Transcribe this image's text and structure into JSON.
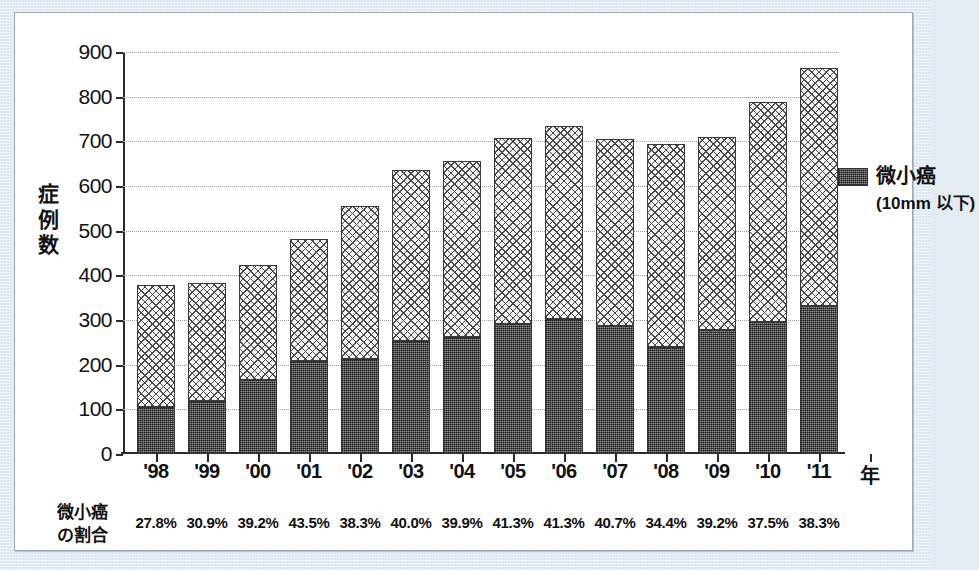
{
  "chart_data": {
    "type": "bar",
    "stacked": true,
    "title": "",
    "xlabel": "年",
    "ylabel": "症例数",
    "ylim": [
      0,
      900
    ],
    "ytick_step": 100,
    "yticks": [
      0,
      100,
      200,
      300,
      400,
      500,
      600,
      700,
      800,
      900
    ],
    "grid": true,
    "legend_position": "right",
    "categories": [
      "'98",
      "'99",
      "'00",
      "'01",
      "'02",
      "'03",
      "'04",
      "'05",
      "'06",
      "'07",
      "'08",
      "'09",
      "'10",
      "'11"
    ],
    "series": [
      {
        "name": "微小癌（10mm 以下）",
        "key": "micro",
        "values": [
          105,
          118,
          166,
          209,
          213,
          254,
          262,
          292,
          303,
          287,
          239,
          278,
          296,
          331
        ]
      },
      {
        "name": "その他",
        "key": "other",
        "values": [
          273,
          264,
          257,
          272,
          343,
          381,
          394,
          415,
          431,
          418,
          456,
          431,
          493,
          533
        ]
      }
    ],
    "totals": [
      378,
      382,
      423,
      481,
      556,
      635,
      656,
      707,
      734,
      705,
      695,
      709,
      789,
      864
    ],
    "ratio_row_label": "微小癌\nの割合",
    "ratios": [
      "27.8%",
      "30.9%",
      "39.2%",
      "43.5%",
      "38.3%",
      "40.0%",
      "39.9%",
      "41.3%",
      "41.3%",
      "40.7%",
      "34.4%",
      "39.2%",
      "37.5%",
      "38.3%"
    ]
  },
  "axes": {
    "y_title_chars": [
      "症",
      "例",
      "数"
    ],
    "y_tick_labels": [
      "900",
      "800",
      "700",
      "600",
      "500",
      "400",
      "300",
      "200",
      "100",
      "0"
    ],
    "x_title": "年"
  },
  "ratio_row": {
    "label_line1": "微小癌",
    "label_line2": "の割合"
  },
  "legend": {
    "title": "微小癌",
    "subtitle": "(10mm 以下)",
    "swatch_name": "micro-cancer-swatch"
  },
  "colors": {
    "page_background": "#dfe9f4",
    "card_background": "#ffffff",
    "card_border": "#9aa7b4",
    "axis": "#2a2a2a",
    "gridline": "#9d9d9d",
    "bar_upper_fill": "#f4f4f4",
    "bar_upper_hatch": "#4a4a4a",
    "bar_lower_fill": "#5a5a5a",
    "text": "#111111"
  }
}
